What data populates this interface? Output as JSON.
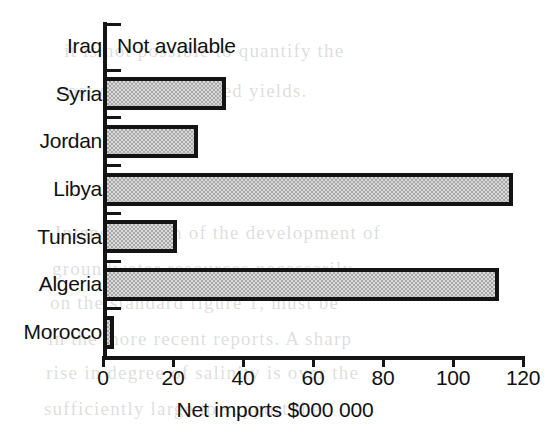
{
  "chart_data": {
    "type": "bar",
    "orientation": "horizontal",
    "title": "",
    "xlabel": "Net imports $000 000",
    "ylabel": "",
    "categories": [
      "Iraq",
      "Syria",
      "Jordan",
      "Libya",
      "Tunisia",
      "Algeria",
      "Morocco"
    ],
    "values": [
      null,
      35,
      27,
      117,
      21,
      113,
      3
    ],
    "xlim": [
      0,
      120
    ],
    "xticks": [
      0,
      20,
      40,
      60,
      80,
      100,
      120
    ],
    "xtick_labels": [
      "0",
      "20",
      "40",
      "60",
      "80",
      "100",
      "120"
    ],
    "grid": false,
    "legend": false,
    "annotations": [
      {
        "category": "Iraq",
        "text": "Not available"
      }
    ],
    "series": [
      {
        "name": "Net imports",
        "values": [
          null,
          35,
          27,
          117,
          21,
          113,
          3
        ],
        "fill": "#d9d9d9",
        "edge": "#131313"
      }
    ]
  },
  "colors": {
    "ink": "#101010",
    "axis": "#151515",
    "bar_fill": "#d9d9d9",
    "bar_edge": "#131313",
    "page": "#ffffff"
  },
  "background_bleed": [
    {
      "text": "it is not possible to quantify the",
      "x": 64,
      "y": 52
    },
    {
      "text": "cost of these reduced yields.",
      "x": 58,
      "y": 92
    },
    {
      "text": "Intensification of the development of",
      "x": 55,
      "y": 232
    },
    {
      "text": "groundwater resources necessarily",
      "x": 52,
      "y": 268
    },
    {
      "text": "on the standard figure 1, must be",
      "x": 50,
      "y": 302
    },
    {
      "text": "in the more recent reports. A sharp",
      "x": 48,
      "y": 338
    },
    {
      "text": "rise in degree of salinity is over the",
      "x": 46,
      "y": 372
    },
    {
      "text": "sufficiently large to support the",
      "x": 44,
      "y": 408
    }
  ]
}
